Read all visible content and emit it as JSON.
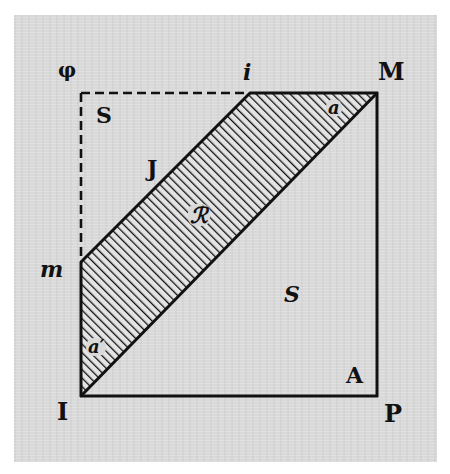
{
  "figure": {
    "type": "geometric-diagram",
    "colors": {
      "paper": "#d9d9d9",
      "ink": "#111111"
    },
    "corner_labels": {
      "top_left": "φ",
      "top_right": "M",
      "bottom_left": "I",
      "bottom_right": "P"
    },
    "edge_labels": {
      "top_point": "i",
      "left_point": "m"
    },
    "region_labels": {
      "upper_left_region": "S",
      "upper_left_region_2": "J",
      "band": "ℛ",
      "lower_right_region": "S",
      "lower_right_corner": "A",
      "band_top_angle": "a",
      "band_bottom_angle": "a′"
    }
  }
}
